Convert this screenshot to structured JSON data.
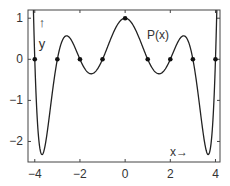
{
  "chart_data": {
    "type": "line",
    "title": "",
    "xlabel": "x→",
    "ylabel_lines": [
      "↑",
      "y"
    ],
    "curve_label": "P(x)",
    "function": "P(x) = prod_{k=1..4} (1 - x^2/k^2)  (interpolates 1 at x=0, 0 at x=±1..±4)",
    "xlim": [
      -4.3,
      4.2
    ],
    "ylim": [
      -2.5,
      1.2
    ],
    "xticks": [
      -4,
      -2,
      0,
      2,
      4
    ],
    "xtick_labels": [
      "−4",
      "−2",
      "0",
      "2",
      "4"
    ],
    "yticks": [
      -2,
      -1,
      0,
      1
    ],
    "ytick_labels": [
      "−2",
      "−1",
      "0",
      "1"
    ],
    "grid": false,
    "legend": "none",
    "nodes": {
      "x": [
        -4,
        -3,
        -2,
        -1,
        0,
        1,
        2,
        3,
        4
      ],
      "y": [
        0,
        0,
        0,
        0,
        1,
        0,
        0,
        0,
        0
      ]
    },
    "series": [
      {
        "name": "P(x)",
        "x": [
          -4.2,
          -4.0,
          -3.8,
          -3.6,
          -3.4,
          -3.0,
          -2.6,
          -2.5,
          -2.0,
          -1.5,
          -1.0,
          -0.5,
          0,
          0.5,
          1.0,
          1.5,
          2.0,
          2.5,
          2.6,
          3.0,
          3.4,
          3.6,
          3.8,
          4.0,
          4.1
        ],
        "y": [
          1.5,
          0,
          -1.77,
          -2.24,
          -1.77,
          0,
          0.57,
          0.55,
          0,
          -0.35,
          0,
          0.67,
          1,
          0.67,
          0,
          -0.35,
          0,
          0.55,
          0.57,
          0,
          -1.77,
          -2.24,
          -1.77,
          0,
          1.0
        ]
      }
    ]
  },
  "axes_box": {
    "left": 28,
    "top": 10,
    "right": 220,
    "bottom": 162
  }
}
